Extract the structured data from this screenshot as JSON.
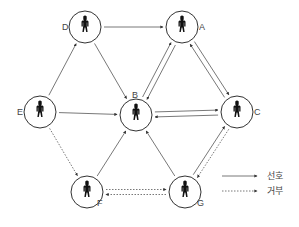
{
  "diagram": {
    "type": "directed-graph",
    "nodes": [
      {
        "id": "A",
        "label": "A",
        "x": 182,
        "y": 27,
        "label_dx": 17,
        "label_dy": 3
      },
      {
        "id": "B",
        "label": "B",
        "x": 136,
        "y": 115,
        "label_dx": -4,
        "label_dy": -17
      },
      {
        "id": "C",
        "label": "C",
        "x": 237,
        "y": 112,
        "label_dx": 17,
        "label_dy": 3
      },
      {
        "id": "D",
        "label": "D",
        "x": 85,
        "y": 27,
        "label_dx": -23,
        "label_dy": 3
      },
      {
        "id": "E",
        "label": "E",
        "x": 40,
        "y": 112,
        "label_dx": -23,
        "label_dy": 3
      },
      {
        "id": "F",
        "label": "F",
        "x": 87,
        "y": 192,
        "label_dx": 10,
        "label_dy": 14
      },
      {
        "id": "G",
        "label": "G",
        "x": 185,
        "y": 192,
        "label_dx": 12,
        "label_dy": 14
      }
    ],
    "edges": [
      {
        "from": "D",
        "to": "A",
        "kind": "preference",
        "offset": 0
      },
      {
        "from": "D",
        "to": "B",
        "kind": "preference",
        "offset": 0
      },
      {
        "from": "E",
        "to": "D",
        "kind": "preference",
        "offset": 0
      },
      {
        "from": "E",
        "to": "B",
        "kind": "preference",
        "offset": 0
      },
      {
        "from": "F",
        "to": "B",
        "kind": "preference",
        "offset": 0
      },
      {
        "from": "G",
        "to": "B",
        "kind": "preference",
        "offset": 0
      },
      {
        "from": "A",
        "to": "B",
        "kind": "preference",
        "offset": -2.5
      },
      {
        "from": "B",
        "to": "A",
        "kind": "preference",
        "offset": -2.5
      },
      {
        "from": "A",
        "to": "C",
        "kind": "preference",
        "offset": -2.5
      },
      {
        "from": "C",
        "to": "A",
        "kind": "preference",
        "offset": -2.5
      },
      {
        "from": "C",
        "to": "B",
        "kind": "preference",
        "offset": -2.5
      },
      {
        "from": "B",
        "to": "C",
        "kind": "preference",
        "offset": -2.5
      },
      {
        "from": "G",
        "to": "C",
        "kind": "preference",
        "offset": -2.5
      },
      {
        "from": "C",
        "to": "G",
        "kind": "rejection",
        "offset": -2.5
      },
      {
        "from": "E",
        "to": "F",
        "kind": "rejection",
        "offset": 0
      },
      {
        "from": "G",
        "to": "F",
        "kind": "rejection",
        "offset": -2.5
      },
      {
        "from": "F",
        "to": "G",
        "kind": "rejection",
        "offset": -2.5
      }
    ],
    "node_radius": 16,
    "colors": {
      "line": "#555555",
      "node_stroke": "#333333",
      "figure": "#111111",
      "text": "#444444"
    }
  },
  "legend": {
    "items": [
      {
        "kind": "preference",
        "label": "선호"
      },
      {
        "kind": "rejection",
        "label": "거부"
      }
    ]
  }
}
